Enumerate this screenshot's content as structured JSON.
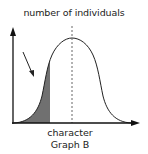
{
  "diagram": {
    "title": "Graph B",
    "y_axis_label": "number of individuals",
    "x_axis_label": "character",
    "curve": "bell-shaped normal distribution",
    "mean_line": "dashed vertical line at peak",
    "shaded_region": "left tail shaded grey",
    "arrow": "points to shaded left tail"
  },
  "colors": {
    "line": "#111111",
    "shade": "#707070",
    "dashed": "#666666",
    "text": "#222222"
  }
}
